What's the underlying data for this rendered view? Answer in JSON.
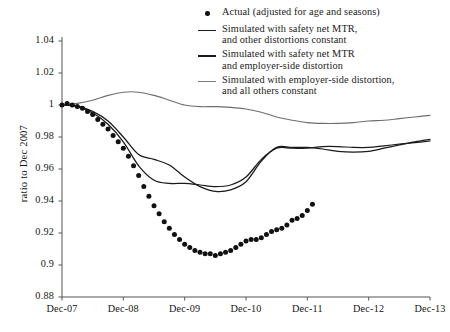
{
  "chart_data": {
    "type": "scatter",
    "title": "",
    "xlabel": "",
    "ylabel": "ratio to Dec 2007",
    "xlim": [
      "Dec-07",
      "Dec-13"
    ],
    "ylim": [
      0.88,
      1.04
    ],
    "ytick_labels": [
      "1.04",
      "1.02",
      "1",
      "0.98",
      "0.96",
      "0.94",
      "0.92",
      "0.9",
      "0.88"
    ],
    "ytick_values": [
      1.04,
      1.02,
      1.0,
      0.98,
      0.96,
      0.94,
      0.92,
      0.9,
      0.88
    ],
    "xtick_labels": [
      "Dec-07",
      "Dec-08",
      "Dec-09",
      "Dec-10",
      "Dec-11",
      "Dec-12",
      "Dec-13"
    ],
    "xtick_values": [
      0,
      12,
      24,
      36,
      48,
      60,
      72
    ],
    "grid": false,
    "legend_position": "top-right",
    "series": [
      {
        "name": "Actual (adjusted for age and seasons)",
        "type": "scatter",
        "marker": "dot",
        "color": "#111111",
        "x": [
          0,
          1,
          2,
          3,
          4,
          5,
          6,
          7,
          8,
          9,
          10,
          11,
          12,
          13,
          14,
          15,
          16,
          17,
          18,
          19,
          20,
          21,
          22,
          23,
          24,
          25,
          26,
          27,
          28,
          29,
          30,
          31,
          32,
          33,
          34,
          35,
          36,
          37,
          38,
          39,
          40,
          41,
          42,
          43,
          44,
          45,
          46,
          47,
          48,
          49
        ],
        "values": [
          1.0,
          1.001,
          1.0,
          0.999,
          0.998,
          0.996,
          0.994,
          0.991,
          0.988,
          0.985,
          0.981,
          0.977,
          0.973,
          0.968,
          0.962,
          0.956,
          0.949,
          0.943,
          0.937,
          0.932,
          0.927,
          0.923,
          0.919,
          0.916,
          0.913,
          0.911,
          0.909,
          0.908,
          0.907,
          0.907,
          0.906,
          0.907,
          0.908,
          0.909,
          0.911,
          0.913,
          0.915,
          0.916,
          0.916,
          0.917,
          0.919,
          0.921,
          0.922,
          0.923,
          0.925,
          0.928,
          0.929,
          0.931,
          0.934,
          0.938
        ]
      },
      {
        "name": "Simulated with safety net MTR,\nand other distortions constant",
        "type": "line",
        "color": "#1a1a1a",
        "x": [
          0,
          3,
          6,
          9,
          12,
          15,
          18,
          21,
          24,
          27,
          30,
          33,
          36,
          39,
          42,
          45,
          48,
          51,
          54,
          57,
          60,
          63,
          66,
          69,
          72
        ],
        "values": [
          1.0,
          0.999,
          0.995,
          0.988,
          0.977,
          0.962,
          0.953,
          0.951,
          0.951,
          0.95,
          0.949,
          0.95,
          0.955,
          0.966,
          0.973,
          0.973,
          0.973,
          0.974,
          0.974,
          0.9735,
          0.9735,
          0.9745,
          0.9755,
          0.9765,
          0.9775
        ]
      },
      {
        "name": "Simulated with safety net MTR\nand employer-side distortion",
        "type": "line",
        "color": "#1a1a1a",
        "x": [
          0,
          3,
          6,
          9,
          12,
          15,
          18,
          21,
          24,
          27,
          30,
          33,
          36,
          39,
          42,
          45,
          48,
          51,
          54,
          57,
          60,
          63,
          66,
          69,
          72
        ],
        "values": [
          1.0,
          0.9995,
          0.996,
          0.99,
          0.98,
          0.969,
          0.966,
          0.9625,
          0.955,
          0.949,
          0.946,
          0.947,
          0.952,
          0.965,
          0.9735,
          0.9735,
          0.9735,
          0.9725,
          0.971,
          0.9705,
          0.971,
          0.973,
          0.975,
          0.977,
          0.9785
        ]
      },
      {
        "name": "Simulated with employer-side distortion,\nand all others constant",
        "type": "line",
        "color": "#6e6e6e",
        "x": [
          0,
          3,
          6,
          9,
          12,
          15,
          18,
          21,
          24,
          27,
          30,
          33,
          36,
          39,
          42,
          45,
          48,
          51,
          54,
          57,
          60,
          63,
          66,
          69,
          72
        ],
        "values": [
          1.0,
          1.001,
          1.003,
          1.006,
          1.008,
          1.008,
          1.006,
          1.003,
          1.0,
          0.999,
          0.999,
          0.9985,
          0.9975,
          0.9955,
          0.9925,
          0.9905,
          0.989,
          0.9885,
          0.9885,
          0.989,
          0.99,
          0.9905,
          0.9915,
          0.9925,
          0.9935
        ]
      }
    ]
  },
  "legend": {
    "items": [
      {
        "marker": "dot",
        "color": "#111111",
        "label": "Actual (adjusted for age and seasons)"
      },
      {
        "marker": "line",
        "color": "#1a1a1a",
        "label": "Simulated with safety net MTR,\nand other distortions constant"
      },
      {
        "marker": "line",
        "color": "#1a1a1a",
        "label": "Simulated with safety net MTR\nand employer-side distortion"
      },
      {
        "marker": "line",
        "color": "#6e6e6e",
        "label": "Simulated with employer-side distortion,\nand all others constant"
      }
    ]
  },
  "axes": {
    "y_title": "ratio to Dec 2007"
  }
}
